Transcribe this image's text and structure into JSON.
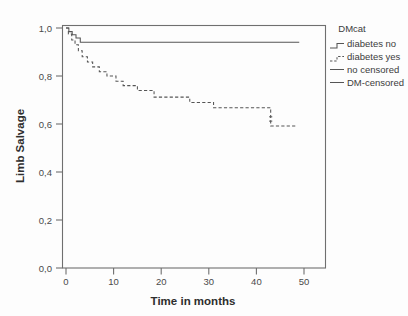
{
  "chart_data": {
    "type": "line",
    "subtype": "kaplan-meier-step",
    "title": "",
    "xlabel": "Time in months",
    "ylabel": "Limb Salvage",
    "xlim": [
      0,
      55
    ],
    "ylim": [
      0.0,
      1.05
    ],
    "xticks": [
      0,
      10,
      20,
      30,
      40,
      50
    ],
    "xtick_labels": [
      "0",
      "10",
      "20",
      "30",
      "40",
      "50"
    ],
    "yticks": [
      0.0,
      0.2,
      0.4,
      0.6,
      0.8,
      1.0
    ],
    "ytick_labels": [
      "0,0",
      "0,2",
      "0,4",
      "0,6",
      "0,8",
      "1,0"
    ],
    "grid": false,
    "decimal_separator": ",",
    "legend_title": "DMcat",
    "legend_position": "right-top",
    "legend_entries": [
      {
        "label": "diabetes no",
        "style": "step-solid"
      },
      {
        "label": "diabetes yes",
        "style": "step-dashed"
      },
      {
        "label": "no censored",
        "style": "line-solid"
      },
      {
        "label": "DM-censored",
        "style": "line-solid"
      }
    ],
    "series": [
      {
        "name": "diabetes no",
        "style": "solid",
        "color": "#555555",
        "points": [
          [
            0.0,
            1.0
          ],
          [
            0.6,
            1.0
          ],
          [
            0.6,
            0.985
          ],
          [
            1.3,
            0.985
          ],
          [
            1.3,
            0.972
          ],
          [
            2.1,
            0.972
          ],
          [
            2.1,
            0.958
          ],
          [
            3.0,
            0.958
          ],
          [
            3.0,
            0.941
          ],
          [
            49.0,
            0.941
          ]
        ]
      },
      {
        "name": "diabetes yes",
        "style": "dashed",
        "color": "#555555",
        "points": [
          [
            0.0,
            1.0
          ],
          [
            0.5,
            1.0
          ],
          [
            0.5,
            0.975
          ],
          [
            1.2,
            0.975
          ],
          [
            1.2,
            0.95
          ],
          [
            1.9,
            0.95
          ],
          [
            1.9,
            0.93
          ],
          [
            2.6,
            0.93
          ],
          [
            2.6,
            0.905
          ],
          [
            3.4,
            0.905
          ],
          [
            3.4,
            0.88
          ],
          [
            4.5,
            0.88
          ],
          [
            4.5,
            0.858
          ],
          [
            5.6,
            0.858
          ],
          [
            5.6,
            0.838
          ],
          [
            7.0,
            0.838
          ],
          [
            7.0,
            0.818
          ],
          [
            8.6,
            0.818
          ],
          [
            8.6,
            0.8
          ],
          [
            10.5,
            0.8
          ],
          [
            10.5,
            0.778
          ],
          [
            12.0,
            0.778
          ],
          [
            12.0,
            0.76
          ],
          [
            15.0,
            0.76
          ],
          [
            15.0,
            0.74
          ],
          [
            18.5,
            0.74
          ],
          [
            18.5,
            0.712
          ],
          [
            26.0,
            0.712
          ],
          [
            26.0,
            0.69
          ],
          [
            31.0,
            0.69
          ],
          [
            31.0,
            0.668
          ],
          [
            43.0,
            0.668
          ],
          [
            43.0,
            0.592
          ],
          [
            48.5,
            0.592
          ]
        ]
      }
    ],
    "censor_marks": [
      {
        "series": "diabetes yes",
        "x": 43.0,
        "y": 0.63
      },
      {
        "series": "diabetes yes",
        "x": 43.0,
        "y": 0.612
      }
    ]
  }
}
